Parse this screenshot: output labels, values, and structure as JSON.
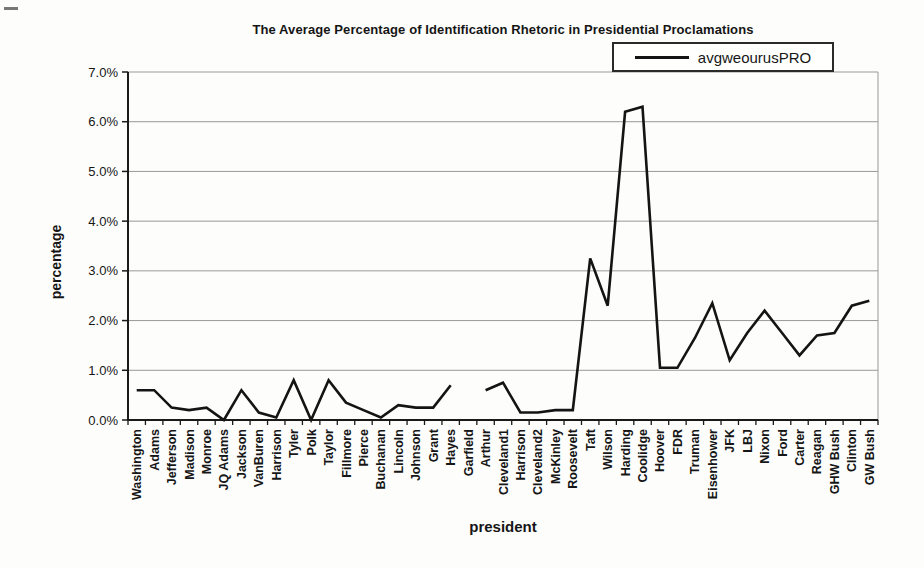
{
  "window": {
    "width": 924,
    "height": 568
  },
  "chart_data": {
    "type": "line",
    "title": "The Average Percentage of Identification Rhetoric in Presidential Proclamations",
    "xlabel": "president",
    "ylabel": "percentage",
    "legend": {
      "position": "top-right",
      "entries": [
        "avgweourusPRO"
      ]
    },
    "categories": [
      "Washington",
      "Adams",
      "Jefferson",
      "Madison",
      "Monroe",
      "JQ Adams",
      "Jackson",
      "VanBuren",
      "Harrison",
      "Tyler",
      "Polk",
      "Taylor",
      "Fillmore",
      "Pierce",
      "Buchanan",
      "Lincoln",
      "Johnson",
      "Grant",
      "Hayes",
      "Garfield",
      "Arthur",
      "Cleveland1",
      "Harrison",
      "Cleveland2",
      "McKinley",
      "Roosevelt",
      "Taft",
      "Wilson",
      "Harding",
      "Coolidge",
      "Hoover",
      "FDR",
      "Truman",
      "Eisenhower",
      "JFK",
      "LBJ",
      "Nixon",
      "Ford",
      "Carter",
      "Reagan",
      "GHW Bush",
      "Clinton",
      "GW Bush"
    ],
    "series": [
      {
        "name": "avgweourusPRO",
        "values": [
          0.6,
          0.6,
          0.25,
          0.2,
          0.25,
          0.0,
          0.6,
          0.15,
          0.05,
          0.8,
          0.0,
          0.8,
          0.35,
          0.2,
          0.05,
          0.3,
          0.25,
          0.25,
          0.7,
          null,
          0.6,
          0.75,
          0.15,
          0.15,
          0.2,
          0.2,
          3.25,
          2.3,
          6.2,
          6.3,
          1.05,
          1.05,
          1.65,
          2.35,
          1.2,
          1.75,
          2.2,
          1.75,
          1.3,
          1.7,
          1.75,
          2.3,
          2.4
        ]
      }
    ],
    "ylim": [
      0,
      7
    ],
    "ytick_step": 1.0,
    "ytick_labels": [
      "0.0%",
      "1.0%",
      "2.0%",
      "3.0%",
      "4.0%",
      "5.0%",
      "6.0%",
      "7.0%"
    ],
    "grid": "horizontal",
    "colors": {
      "line": "#141414",
      "grid": "#999999",
      "axis": "#1a1a1a",
      "background": "#fdfdfc",
      "text": "#151515"
    }
  }
}
